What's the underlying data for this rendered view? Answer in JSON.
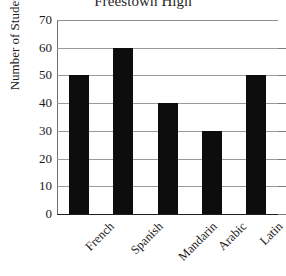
{
  "chart_data": {
    "type": "bar",
    "title": "Freestown High",
    "xlabel": "",
    "ylabel": "Number of Students",
    "categories": [
      "French",
      "Spanish",
      "Mandarin",
      "Arabic",
      "Latin"
    ],
    "values": [
      50,
      60,
      40,
      30,
      50
    ],
    "ylim": [
      0,
      70
    ],
    "ytick_step": 10,
    "ytick_labels": [
      "70",
      "60",
      "50",
      "40",
      "30",
      "20",
      "10",
      "0"
    ],
    "ytick_values": [
      70,
      60,
      50,
      40,
      30,
      20,
      10,
      0
    ],
    "grid": "horizontal",
    "legend": "none",
    "bar_color": "#0d0d0d",
    "gridline_color": "#9a9a9a",
    "axis_color": "#1f1f1f",
    "series": [
      {
        "name": "Number of Students",
        "values": [
          50,
          60,
          40,
          30,
          50
        ]
      }
    ],
    "annotations": []
  }
}
